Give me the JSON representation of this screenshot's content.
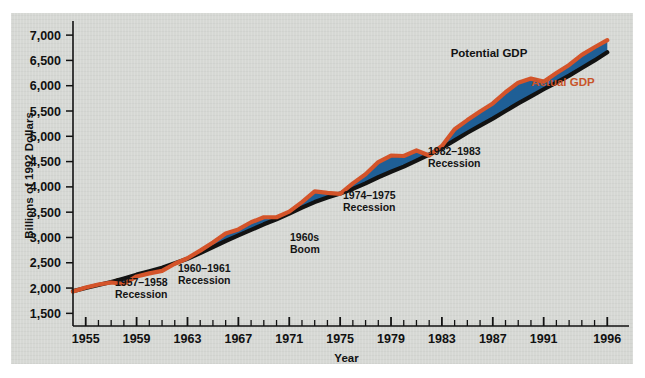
{
  "figure": {
    "background_color": "#ffffff",
    "panel_color": "#d6d8d4"
  },
  "axes": {
    "ylabel": "Billions of 1992 Dollars",
    "xlabel": "Year",
    "y_ticks": [
      "1,500",
      "2,000",
      "2,500",
      "3,000",
      "3,500",
      "4,000",
      "4,500",
      "5,000",
      "5,500",
      "6,000",
      "6,500",
      "7,000"
    ],
    "x_ticks": [
      "1955",
      "1959",
      "1963",
      "1967",
      "1971",
      "1975",
      "1979",
      "1983",
      "1987",
      "1991",
      "1996"
    ]
  },
  "legend": {
    "potential": "Potential GDP",
    "actual": "Actual GDP",
    "potential_color": "#121212",
    "actual_color": "#c8542a"
  },
  "annotations": [
    {
      "id": "rec-1957",
      "line1": "1957–1958",
      "line2": "Recession"
    },
    {
      "id": "rec-1960",
      "line1": "1960–1961",
      "line2": "Recession"
    },
    {
      "id": "boom-1960s",
      "line1": "1960s",
      "line2": "Boom"
    },
    {
      "id": "rec-1974",
      "line1": "1974–1975",
      "line2": "Recession"
    },
    {
      "id": "rec-1982",
      "line1": "1982–1983",
      "line2": "Recession"
    }
  ],
  "chart_data": {
    "type": "line",
    "title": "",
    "xlabel": "Year",
    "ylabel": "Billions of 1992 Dollars",
    "xlim": [
      1954,
      1997
    ],
    "ylim": [
      1250,
      7200
    ],
    "grid": false,
    "legend_position": "inside-upper-right",
    "fill_between": {
      "color": "#1f5f96",
      "description": "Gap shaded where Potential GDP exceeds Actual GDP"
    },
    "x": [
      1954,
      1955,
      1956,
      1957,
      1958,
      1959,
      1960,
      1961,
      1962,
      1963,
      1964,
      1965,
      1966,
      1967,
      1968,
      1969,
      1970,
      1971,
      1972,
      1973,
      1974,
      1975,
      1976,
      1977,
      1978,
      1979,
      1980,
      1981,
      1982,
      1983,
      1984,
      1985,
      1986,
      1987,
      1988,
      1989,
      1990,
      1991,
      1992,
      1993,
      1994,
      1995,
      1996
    ],
    "series": [
      {
        "name": "Potential GDP",
        "color": "#121212",
        "values": [
          1940,
          2000,
          2060,
          2120,
          2190,
          2265,
          2330,
          2400,
          2490,
          2580,
          2690,
          2810,
          2930,
          3040,
          3150,
          3260,
          3360,
          3470,
          3590,
          3700,
          3790,
          3870,
          3960,
          4070,
          4190,
          4300,
          4400,
          4520,
          4640,
          4770,
          4920,
          5070,
          5210,
          5350,
          5500,
          5650,
          5790,
          5930,
          6060,
          6200,
          6350,
          6500,
          6660
        ]
      },
      {
        "name": "Actual GDP",
        "color": "#c8542a",
        "values": [
          1930,
          2010,
          2070,
          2110,
          2080,
          2230,
          2290,
          2340,
          2480,
          2590,
          2740,
          2900,
          3080,
          3160,
          3300,
          3400,
          3400,
          3510,
          3700,
          3910,
          3880,
          3860,
          4070,
          4250,
          4490,
          4620,
          4610,
          4720,
          4620,
          4810,
          5140,
          5320,
          5490,
          5650,
          5870,
          6060,
          6140,
          6080,
          6250,
          6410,
          6610,
          6760,
          6900
        ]
      }
    ]
  }
}
